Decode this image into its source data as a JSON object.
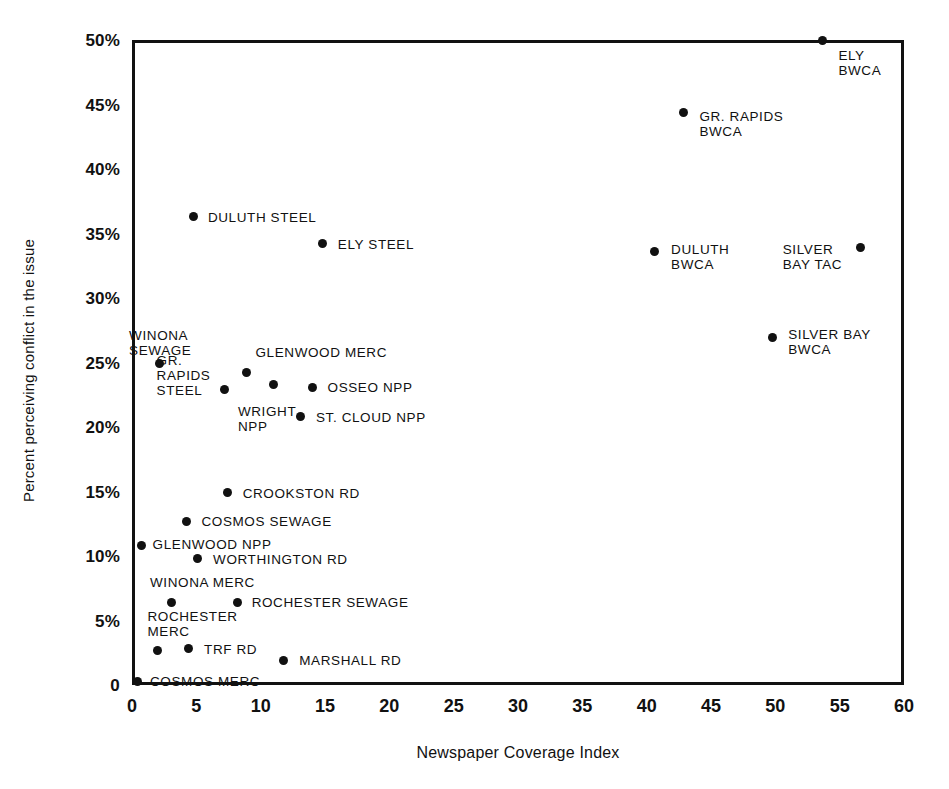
{
  "chart_data": {
    "type": "scatter",
    "title": "",
    "xlabel": "Newspaper Coverage Index",
    "ylabel": "Percent perceiving conflict in the issue",
    "xlim": [
      0,
      60
    ],
    "ylim": [
      0,
      50
    ],
    "xticks": [
      "0",
      "5",
      "10",
      "15",
      "20",
      "25",
      "30",
      "35",
      "40",
      "45",
      "50",
      "55",
      "60"
    ],
    "xtick_values": [
      0,
      5,
      10,
      15,
      20,
      25,
      30,
      35,
      40,
      45,
      50,
      55,
      60
    ],
    "yticks": [
      "0",
      "5%",
      "10%",
      "15%",
      "20%",
      "25%",
      "30%",
      "35%",
      "40%",
      "45%",
      "50%"
    ],
    "ytick_values": [
      0,
      5,
      10,
      15,
      20,
      25,
      30,
      35,
      40,
      45,
      50
    ],
    "grid": false,
    "legend": "none",
    "marker": "filled-circle",
    "marker_color": "#111111",
    "points": [
      {
        "label": "ELY\nBWCA",
        "x": 53.7,
        "y": 50.0,
        "lx": 54.9,
        "ly": 48.2,
        "align": "right"
      },
      {
        "label": "GR. RAPIDS\nBWCA",
        "x": 42.9,
        "y": 44.4,
        "lx": 44.1,
        "ly": 43.5,
        "align": "right"
      },
      {
        "label": "DULUTH STEEL",
        "x": 4.8,
        "y": 36.3,
        "lx": 5.9,
        "ly": 36.3,
        "align": "right"
      },
      {
        "label": "ELY STEEL",
        "x": 14.8,
        "y": 34.2,
        "lx": 16.0,
        "ly": 34.2,
        "align": "right"
      },
      {
        "label": "DULUTH\nBWCA",
        "x": 40.6,
        "y": 33.6,
        "lx": 41.9,
        "ly": 33.2,
        "align": "right"
      },
      {
        "label": "SILVER\nBAY TAC",
        "x": 56.6,
        "y": 33.9,
        "lx": 55.2,
        "ly": 33.2,
        "align": "left"
      },
      {
        "label": "SILVER BAY\nBWCA",
        "x": 49.8,
        "y": 26.9,
        "lx": 51.0,
        "ly": 26.6,
        "align": "right"
      },
      {
        "label": "WINONA\nSEWAGE",
        "x": 2.1,
        "y": 24.9,
        "lx": 2.2,
        "ly": 27.7,
        "align": "below"
      },
      {
        "label": "GLENWOOD MERC",
        "x": 8.9,
        "y": 24.2,
        "lx": 9.6,
        "ly": 25.8,
        "align": "right"
      },
      {
        "label": "GR.\nRAPIDS\nSTEEL",
        "x": 7.2,
        "y": 22.9,
        "lx": 6.1,
        "ly": 24.0,
        "align": "left"
      },
      {
        "label": "WRIGHT\nNPP",
        "x": 11.0,
        "y": 23.3,
        "lx": 10.5,
        "ly": 21.8,
        "align": "below"
      },
      {
        "label": "OSSEO NPP",
        "x": 14.0,
        "y": 23.1,
        "lx": 15.2,
        "ly": 23.1,
        "align": "right"
      },
      {
        "label": "ST. CLOUD NPP",
        "x": 13.1,
        "y": 20.8,
        "lx": 14.3,
        "ly": 20.8,
        "align": "right"
      },
      {
        "label": "CROOKSTON RD",
        "x": 7.4,
        "y": 14.9,
        "lx": 8.6,
        "ly": 14.9,
        "align": "right"
      },
      {
        "label": "COSMOS SEWAGE",
        "x": 4.2,
        "y": 12.7,
        "lx": 5.4,
        "ly": 12.7,
        "align": "right"
      },
      {
        "label": "GLENWOOD NPP",
        "x": 0.7,
        "y": 10.8,
        "lx": 1.6,
        "ly": 10.9,
        "align": "right"
      },
      {
        "label": "WORTHINGTON RD",
        "x": 5.1,
        "y": 9.8,
        "lx": 6.3,
        "ly": 9.8,
        "align": "right"
      },
      {
        "label": "WINONA MERC",
        "x": 3.1,
        "y": 6.4,
        "lx": 1.4,
        "ly": 8.0,
        "align": "right"
      },
      {
        "label": "ROCHESTER SEWAGE",
        "x": 8.2,
        "y": 6.4,
        "lx": 9.3,
        "ly": 6.4,
        "align": "right"
      },
      {
        "label": "ROCHESTER\nMERC",
        "x": 2.0,
        "y": 2.7,
        "lx": 1.2,
        "ly": 4.7,
        "align": "right"
      },
      {
        "label": "TRF RD",
        "x": 4.4,
        "y": 2.8,
        "lx": 5.6,
        "ly": 2.8,
        "align": "right"
      },
      {
        "label": "MARSHALL RD",
        "x": 11.8,
        "y": 1.9,
        "lx": 13.0,
        "ly": 1.9,
        "align": "right"
      },
      {
        "label": "COSMOS MERC",
        "x": 0.4,
        "y": 0.3,
        "lx": 1.4,
        "ly": 0.3,
        "align": "right"
      }
    ]
  }
}
